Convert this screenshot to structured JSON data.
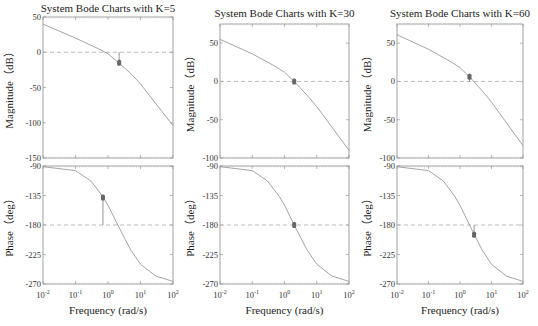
{
  "chart_data": [
    {
      "type": "line",
      "title": "System Bode Charts with K=5",
      "K": 5,
      "magnitude": {
        "ylabel": "Magnitude（dB）",
        "ylim": [
          -150,
          50
        ],
        "yticks": [
          50,
          0,
          -50,
          -100,
          -150
        ],
        "reference_line": 0,
        "x": [
          0.01,
          0.1,
          0.5,
          1,
          2,
          5,
          10,
          100
        ],
        "y": [
          40,
          20,
          5,
          -2,
          -14,
          -30,
          -45,
          -104
        ],
        "marker": {
          "x": 2.2,
          "y": -15
        }
      },
      "phase": {
        "ylabel": "Phase（deg）",
        "ylim": [
          -270,
          -90
        ],
        "yticks": [
          -90,
          -135,
          -180,
          -225,
          -270
        ],
        "reference_line": -180,
        "x": [
          0.01,
          0.1,
          0.3,
          0.7,
          1,
          2,
          5,
          10,
          30,
          100
        ],
        "y": [
          -91,
          -97,
          -113,
          -137,
          -150,
          -180,
          -218,
          -240,
          -258,
          -266
        ],
        "marker": {
          "x": 0.7,
          "y": -138
        }
      },
      "xlabel": "Frequency (rad/s)",
      "xticks": [
        "10^-2",
        "10^-1",
        "10^0",
        "10^1",
        "10^2"
      ],
      "xlim": [
        0.01,
        100
      ],
      "xscale": "log"
    },
    {
      "type": "line",
      "title": "System Bode Charts with K=30",
      "K": 30,
      "magnitude": {
        "ylabel": "Magnitude（dB）",
        "ylim": [
          -100,
          75
        ],
        "yticks": [
          50,
          0,
          -50,
          -100
        ],
        "reference_line": 0,
        "x": [
          0.01,
          0.1,
          0.5,
          1,
          2,
          5,
          10,
          100
        ],
        "y": [
          55,
          36,
          20,
          12,
          0,
          -18,
          -33,
          -90
        ],
        "marker": {
          "x": 2.0,
          "y": 0
        }
      },
      "phase": {
        "ylabel": "Phase（deg）",
        "ylim": [
          -270,
          -90
        ],
        "yticks": [
          -90,
          -135,
          -180,
          -225,
          -270
        ],
        "reference_line": -180,
        "x": [
          0.01,
          0.1,
          0.3,
          0.7,
          1,
          2,
          5,
          10,
          30,
          100
        ],
        "y": [
          -91,
          -97,
          -113,
          -137,
          -150,
          -180,
          -218,
          -240,
          -258,
          -266
        ],
        "marker": {
          "x": 2.0,
          "y": -180
        }
      },
      "xlabel": "Frequency (rad/s)",
      "xticks": [
        "10^-2",
        "10^-1",
        "10^0",
        "10^1",
        "10^2"
      ],
      "xlim": [
        0.01,
        100
      ],
      "xscale": "log"
    },
    {
      "type": "line",
      "title": "System Bode Charts with K=60",
      "K": 60,
      "magnitude": {
        "ylabel": "Magnitude（dB）",
        "ylim": [
          -100,
          75
        ],
        "yticks": [
          50,
          0,
          -50,
          -100
        ],
        "reference_line": 0,
        "x": [
          0.01,
          0.1,
          0.5,
          1,
          2,
          5,
          10,
          100
        ],
        "y": [
          61,
          42,
          26,
          18,
          6,
          -12,
          -27,
          -84
        ],
        "marker": {
          "x": 2.0,
          "y": 6
        }
      },
      "phase": {
        "ylabel": "Phase（deg）",
        "ylim": [
          -270,
          -90
        ],
        "yticks": [
          -90,
          -135,
          -180,
          -225,
          -270
        ],
        "reference_line": -180,
        "x": [
          0.01,
          0.1,
          0.3,
          0.7,
          1,
          2,
          5,
          10,
          30,
          100
        ],
        "y": [
          -91,
          -97,
          -113,
          -137,
          -150,
          -180,
          -218,
          -240,
          -258,
          -266
        ],
        "marker": {
          "x": 2.8,
          "y": -195
        }
      },
      "xlabel": "Frequency (rad/s)",
      "xticks": [
        "10^-2",
        "10^-1",
        "10^0",
        "10^1",
        "10^2"
      ],
      "xlim": [
        0.01,
        100
      ],
      "xscale": "log"
    }
  ],
  "layout": {
    "panels": [
      {
        "left": 43,
        "right": 173,
        "mag_top": 17,
        "mag_bottom": 158,
        "ph_top": 166,
        "ph_bottom": 284
      },
      {
        "left": 220,
        "right": 349,
        "mag_top": 24,
        "mag_bottom": 158,
        "ph_top": 166,
        "ph_bottom": 284
      },
      {
        "left": 397,
        "right": 523,
        "mag_top": 24,
        "mag_bottom": 158,
        "ph_top": 166,
        "ph_bottom": 284
      }
    ],
    "colors": {
      "axis": "#8a8a8a",
      "curve": "#9a9a9a",
      "ref": "#aaaaaa",
      "marker": "#666666",
      "text": "#222222"
    }
  }
}
